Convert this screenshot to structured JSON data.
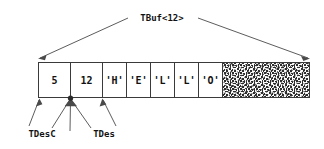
{
  "diagram": {
    "title": "TBuf<12>",
    "buffer": {
      "name": "TBuf<12>",
      "capacity": 12,
      "cells": [
        {
          "index": 0,
          "label": "5",
          "role": "length-byte",
          "filled": true
        },
        {
          "index": 1,
          "label": "12",
          "role": "max-length",
          "filled": true
        },
        {
          "index": 2,
          "label": "'H'",
          "role": "data",
          "filled": true
        },
        {
          "index": 3,
          "label": "'E'",
          "role": "data",
          "filled": true
        },
        {
          "index": 4,
          "label": "'L'",
          "role": "data",
          "filled": true
        },
        {
          "index": 5,
          "label": "'L'",
          "role": "data",
          "filled": true
        },
        {
          "index": 6,
          "label": "'O'",
          "role": "data",
          "filled": true
        }
      ],
      "unused_region": {
        "label": "",
        "role": "unused-space",
        "filled": false,
        "pattern": "speckled"
      }
    },
    "pointers": [
      {
        "id": "tdesc",
        "label": "TDesC",
        "target_cell_index": 0,
        "fan_count": 1
      },
      {
        "id": "tdes",
        "label": "TDes",
        "target_cell_index": 1,
        "fan_count": 3
      },
      {
        "id": "tbuf",
        "label": "",
        "target_cell_index": 2,
        "fan_count": 1
      }
    ],
    "pointer_labels": [
      {
        "text": "TDesC"
      },
      {
        "text": "TDes"
      }
    ],
    "colors": {
      "stroke": "#3a3a3a",
      "line": "#4a4a4a",
      "text": "#111111",
      "background": "#ffffff",
      "hatch_dark": "#2b2b2b",
      "hatch_light": "#ffffff"
    }
  }
}
